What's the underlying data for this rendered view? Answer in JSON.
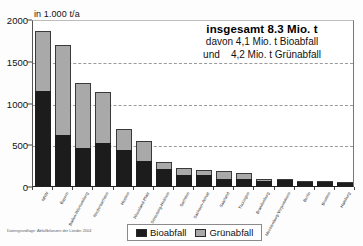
{
  "chart_data": {
    "type": "bar",
    "stacked": true,
    "title": "",
    "unit_label": "in 1.000 t/a",
    "xlabel": "",
    "ylabel": "",
    "ylim": [
      0,
      2000
    ],
    "yticks": [
      0,
      500,
      1000,
      1500,
      2000
    ],
    "ytick_labels": [
      "0",
      "500",
      "1000",
      "1500",
      "2000"
    ],
    "grid": true,
    "grid_style": "dashed horizontal",
    "legend_position": "bottom-center",
    "categories": [
      "NRW",
      "Bayern",
      "Baden-Württemberg",
      "Niedersachsen",
      "Hessen",
      "Rheinland-Pfalz",
      "Schleswig-Holstein",
      "Sachsen",
      "Sachsen-Anhalt",
      "Saarland",
      "Thüringen",
      "Brandenburg",
      "Mecklenburg-Vorpommern",
      "Berlin",
      "Bremen",
      "Hamburg"
    ],
    "series": [
      {
        "name": "Bioabfall",
        "color": "#1c1c1c",
        "values": [
          1140,
          610,
          450,
          515,
          435,
          305,
          205,
          130,
          130,
          80,
          90,
          55,
          70,
          50,
          60,
          45
        ]
      },
      {
        "name": "Grünabfall",
        "color": "#a9a9a9",
        "values": [
          715,
          1080,
          780,
          615,
          245,
          240,
          85,
          85,
          65,
          95,
          70,
          35,
          15,
          15,
          5,
          5
        ]
      }
    ],
    "totals": [
      1855,
      1690,
      1230,
      1130,
      680,
      545,
      290,
      215,
      195,
      175,
      160,
      90,
      85,
      65,
      65,
      50
    ],
    "annotation": {
      "headline": "insgesamt 8.3 Mio. t",
      "line2": "davon 4,1 Mio. t Bioabfall",
      "line3": "und    4,2 Mio. t Grünabfall"
    },
    "legend": [
      {
        "label": "Bioabfall",
        "color": "#1c1c1c"
      },
      {
        "label": "Grünabfall",
        "color": "#a9a9a9"
      }
    ],
    "source_note": "Datengrundlage: Abfallbilanzen der Länder 2004"
  }
}
